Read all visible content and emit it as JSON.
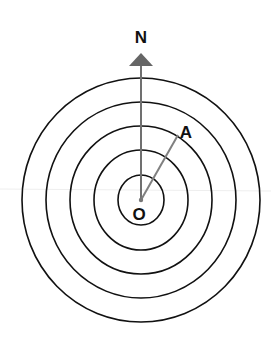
{
  "diagram": {
    "labels": {
      "north": "N",
      "point_a": "A",
      "origin": "O"
    },
    "colors": {
      "circle": "#111111",
      "arrow": "#707070",
      "segment": "#808080",
      "text": "#111111",
      "guide_line": "#eeeeee"
    },
    "center": {
      "x": 141,
      "y": 200
    },
    "circles": [
      {
        "rx": 23,
        "ry": 25
      },
      {
        "rx": 47,
        "ry": 50
      },
      {
        "rx": 71,
        "ry": 74
      },
      {
        "rx": 95,
        "ry": 98
      },
      {
        "rx": 119,
        "ry": 122
      }
    ],
    "point_a": {
      "x": 178,
      "y": 137
    }
  }
}
